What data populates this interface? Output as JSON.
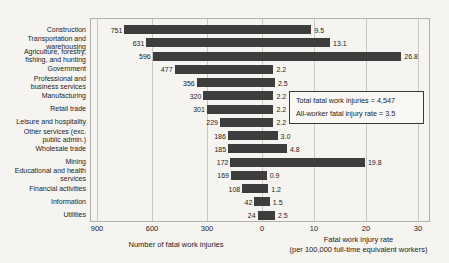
{
  "chart_data": {
    "type": "bar",
    "variant": "bidirectional-horizontal",
    "title": "",
    "categories": [
      [
        "Construction"
      ],
      [
        "Transportation and",
        "warehousing"
      ],
      [
        "Agriculture, forestry,",
        "fishing, and hunting"
      ],
      [
        "Government"
      ],
      [
        "Professional and",
        "business services"
      ],
      [
        "Manufacturing"
      ],
      [
        "Retail trade"
      ],
      [
        "Leisure and hospitality"
      ],
      [
        "Other services (exc.",
        "public admin.)"
      ],
      [
        "Wholesale trade"
      ],
      [
        "Mining"
      ],
      [
        "Educational and health",
        "services"
      ],
      [
        "Financial activities"
      ],
      [
        "Information"
      ],
      [
        "Utilities"
      ]
    ],
    "series": [
      {
        "name": "Number of fatal work injuries",
        "direction": "left",
        "values": [
          751,
          631,
          596,
          477,
          356,
          320,
          301,
          229,
          186,
          185,
          172,
          169,
          108,
          42,
          24
        ],
        "labels": [
          "751",
          "631",
          "596",
          "477",
          "356",
          "320",
          "301",
          "229",
          "186",
          "185",
          "172",
          "169",
          "108",
          "42",
          "24"
        ],
        "axis": {
          "min": 0,
          "max": 900,
          "ticks": [
            900,
            600,
            300,
            0
          ]
        }
      },
      {
        "name": "Fatal work injury rate",
        "direction": "right",
        "values": [
          9.5,
          13.1,
          26.8,
          2.2,
          2.5,
          2.2,
          2.2,
          2.2,
          3.0,
          4.8,
          19.8,
          0.9,
          1.2,
          1.5,
          2.5
        ],
        "labels": [
          "9.5",
          "13.1",
          "26.8",
          "2.2",
          "2.5",
          "2.2",
          "2.2",
          "2.2",
          "3.0",
          "4.8",
          "19.8",
          "0.9",
          "1.2",
          "1.5",
          "2.5"
        ],
        "axis": {
          "min": 0,
          "max": 30,
          "ticks": [
            0,
            10,
            20,
            30
          ]
        }
      }
    ],
    "xlabel_left": "Number of fatal work injuries",
    "xlabel_right_line1": "Fatal work injury rate",
    "xlabel_right_line2": "(per 100,000 full-time equivalent workers)",
    "annotation": {
      "line1": "Total fatal work injuries = 4,547",
      "line2": "All-worker fatal injury rate = 3.5"
    },
    "bar_color": "#3d3d3d",
    "grid": true,
    "legend_position": "none"
  }
}
